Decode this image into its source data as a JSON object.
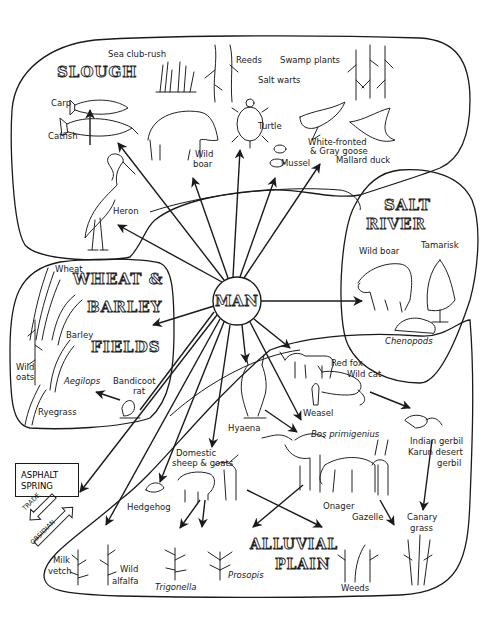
{
  "diagram": {
    "center_node": "MAN",
    "regions": {
      "slough": {
        "title": "SLOUGH",
        "items": {
          "sea_club_rush": "Sea club-rush",
          "reeds": "Reeds",
          "swamp_plants": "Swamp plants",
          "salt_warts": "Salt warts",
          "carp": "Carp",
          "catfish": "Catfish",
          "wild_boar_1": "Wild",
          "wild_boar_2": "boar",
          "turtle": "Turtle",
          "mussel": "Mussel",
          "goose_1": "White-fronted",
          "goose_2": "& Gray goose",
          "mallard": "Mallard duck",
          "heron": "Heron"
        }
      },
      "salt_river": {
        "title_1": "SALT",
        "title_2": "RIVER",
        "items": {
          "wild_boar": "Wild boar",
          "tamarisk": "Tamarisk",
          "chenopods": "Chenopods"
        }
      },
      "wheat_barley_fields": {
        "title_1": "WHEAT &",
        "title_2": "BARLEY",
        "title_3": "FIELDS",
        "items": {
          "wheat": "Wheat",
          "barley": "Barley",
          "wild_oats_1": "Wild",
          "wild_oats_2": "oats",
          "aegilops": "Aegilops",
          "bandicoot_1": "Bandicoot",
          "bandicoot_2": "rat",
          "ryegrass": "Ryegrass"
        }
      },
      "alluvial_plain": {
        "title_1": "ALLUVIAL",
        "title_2": "PLAIN",
        "items": {
          "red_fox": "Red fox",
          "wild_cat": "Wild cat",
          "weasel": "Weasel",
          "hyaena": "Hyaena",
          "bos": "Bos primigenius",
          "indian_gerbil": "Indian gerbil",
          "karun_1": "Karun desert",
          "karun_2": "gerbil",
          "sheep_1": "Domestic",
          "sheep_2": "sheep & goats",
          "hedgehog": "Hedgehog",
          "onager": "Onager",
          "gazelle": "Gazelle",
          "canary_1": "Canary",
          "canary_2": "grass",
          "milk_vetch_1": "Milk",
          "milk_vetch_2": "vetch",
          "wild_alfalfa_1": "Wild",
          "wild_alfalfa_2": "alfalfa",
          "trigonella": "Trigonella",
          "prosopis": "Prosopis",
          "weeds": "Weeds"
        }
      }
    },
    "external": {
      "asphalt_1": "ASPHALT",
      "asphalt_2": "SPRING",
      "trade": "TRADE",
      "obsidian": "OBSIDIAN"
    },
    "colors": {
      "ink": "#1a1a1a",
      "background": "#ffffff"
    }
  }
}
